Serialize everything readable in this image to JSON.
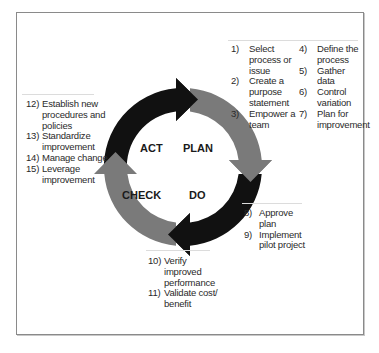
{
  "diagram": {
    "type": "PDCA cycle",
    "colors": {
      "dark_arrow": "#111111",
      "light_arrow": "#7a7a7a",
      "frame": "#8a8a8a",
      "separator": "#dcdcdc"
    },
    "phases": [
      {
        "label": "PLAN"
      },
      {
        "label": "DO"
      },
      {
        "label": "CHECK"
      },
      {
        "label": "ACT"
      }
    ]
  },
  "plan_steps": {
    "left": [
      {
        "num": "1)",
        "text": "Select process or issue"
      },
      {
        "num": "2)",
        "text": "Create a purpose statement"
      },
      {
        "num": "3)",
        "text": "Empower a team"
      }
    ],
    "right": [
      {
        "num": "4)",
        "text": "Define the process"
      },
      {
        "num": "5)",
        "text": "Gather data"
      },
      {
        "num": "6)",
        "text": "Control variation"
      },
      {
        "num": "7)",
        "text": "Plan for improvement"
      }
    ]
  },
  "do_steps": [
    {
      "num": "8)",
      "text": "Approve plan"
    },
    {
      "num": "9)",
      "text": "Implement pilot project"
    }
  ],
  "check_steps": [
    {
      "num": "10)",
      "text": "Verify improved performance"
    },
    {
      "num": "11)",
      "text": "Validate cost/ benefit"
    }
  ],
  "act_steps": [
    {
      "num": "12)",
      "text": "Establish new procedures and policies"
    },
    {
      "num": "13)",
      "text": "Standardize improvement"
    },
    {
      "num": "14)",
      "text": "Manage change"
    },
    {
      "num": "15)",
      "text": "Leverage improvement"
    }
  ]
}
